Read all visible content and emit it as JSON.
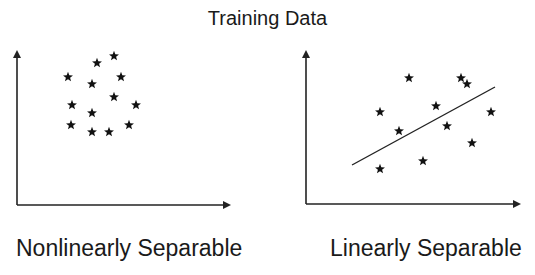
{
  "title": "Training Data",
  "colors": {
    "ink": "#111111",
    "axis": "#222222",
    "background": "#ffffff"
  },
  "panels": [
    {
      "caption": "Nonlinearly Separable",
      "axes": {
        "origin": [
          17,
          205
        ],
        "x_end": [
          231,
          205
        ],
        "y_end": [
          17,
          50
        ]
      },
      "points": [
        [
          114,
          56
        ],
        [
          97,
          63
        ],
        [
          68,
          77
        ],
        [
          92,
          84
        ],
        [
          121,
          77
        ],
        [
          114,
          97
        ],
        [
          72,
          105
        ],
        [
          136,
          105
        ],
        [
          92,
          113
        ],
        [
          71,
          125
        ],
        [
          92,
          132
        ],
        [
          109,
          132
        ],
        [
          129,
          125
        ]
      ],
      "separator": null
    },
    {
      "caption": "Linearly Separable",
      "axes": {
        "origin": [
          306,
          204
        ],
        "x_end": [
          521,
          204
        ],
        "y_end": [
          306,
          50
        ]
      },
      "points": [
        [
          409,
          78
        ],
        [
          461,
          78
        ],
        [
          467,
          84
        ],
        [
          380,
          112
        ],
        [
          436,
          106
        ],
        [
          491,
          112
        ],
        [
          399,
          131
        ],
        [
          447,
          126
        ],
        [
          472,
          143
        ],
        [
          423,
          161
        ],
        [
          380,
          169
        ]
      ],
      "separator": {
        "from": [
          352,
          165
        ],
        "to": [
          495,
          87
        ]
      }
    }
  ],
  "icons": {
    "point_marker": "star-icon",
    "axis_arrow": "arrow-icon"
  }
}
